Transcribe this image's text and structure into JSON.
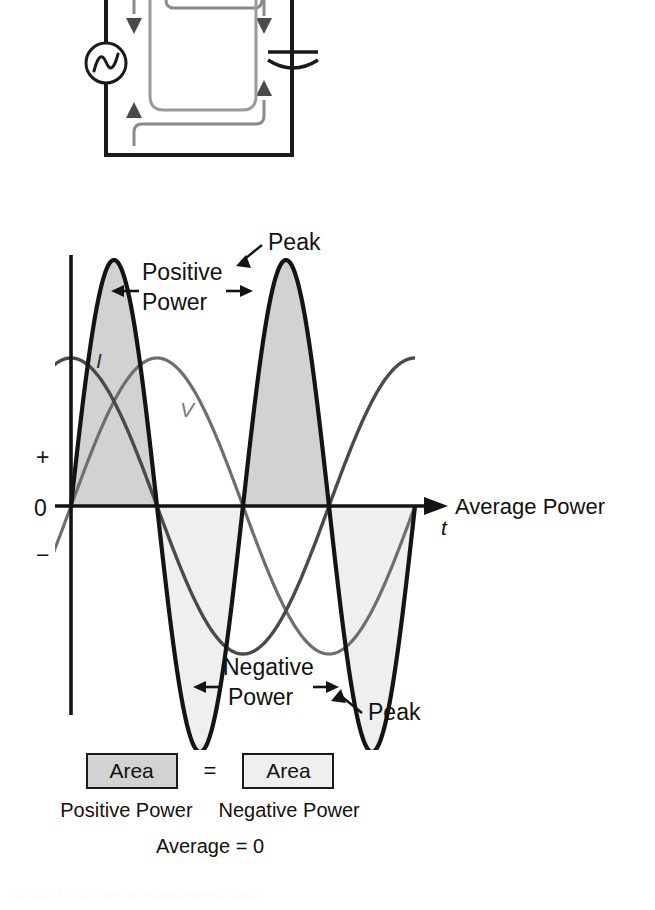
{
  "figure": {
    "caption": "FIGURE 15-10 Power in a capacitive AC circuit."
  },
  "circuit": {
    "title": "capacitive-ac-circuit",
    "source_label": "AC source",
    "component_label": "capacitor",
    "current_loop_inner": "charging current (clockwise)",
    "current_loop_outer": "discharging current (counter-clockwise)"
  },
  "chart_labels": {
    "axis_plus": "+",
    "axis_zero": "0",
    "axis_minus": "−",
    "axis_time": "t",
    "average_power": "Average Power",
    "current_curve": "I",
    "voltage_curve": "V",
    "positive_power_line1": "Positive",
    "positive_power_line2": "Power",
    "negative_power_line1": "Negative",
    "negative_power_line2": "Power",
    "peak_top": "Peak",
    "peak_bottom": "Peak"
  },
  "legend": {
    "area_positive_label": "Area",
    "area_negative_label": "Area",
    "equals": "=",
    "caption_positive": "Positive Power",
    "caption_negative": "Negative Power",
    "average_text": "Average = 0"
  },
  "colors": {
    "ink": "#111111",
    "curve_dark": "#1a1a1a",
    "curve_gray": "#6e6e6e",
    "fill_positive": "#d2d2d2",
    "fill_negative": "#efefef",
    "background": "#ffffff"
  },
  "chart_data": {
    "type": "line",
    "title": "Power in a capacitive AC circuit",
    "xlabel": "t",
    "ylabel": "",
    "x": [
      0,
      0.05,
      0.1,
      0.15,
      0.2,
      0.25,
      0.3,
      0.35,
      0.4,
      0.45,
      0.5,
      0.55,
      0.6,
      0.65,
      0.7,
      0.75,
      0.8,
      0.85,
      0.9,
      0.95,
      1.0
    ],
    "xlim": [
      0,
      1.0
    ],
    "ylim": [
      -1,
      1
    ],
    "grid": false,
    "legend_position": "inline-curve-labels",
    "annotations": [
      {
        "text": "Peak",
        "target": "positive power maximum (2nd lobe)"
      },
      {
        "text": "Peak",
        "target": "negative power minimum (2nd trough)"
      },
      {
        "text": "Positive Power",
        "target": "shaded area above zero axis"
      },
      {
        "text": "Negative Power",
        "target": "shaded area below zero axis"
      },
      {
        "text": "Average Power",
        "target": "zero axis line"
      }
    ],
    "series": [
      {
        "name": "I",
        "description": "current, leads voltage by 90 degrees",
        "color": "#1a1a1a",
        "amplitude": 0.62,
        "phase_deg": 90,
        "cycles": 1,
        "values": [
          0.62,
          0.53,
          0.27,
          -0.1,
          -0.43,
          -0.62,
          -0.6,
          -0.36,
          -0.02,
          0.32,
          0.57,
          0.62,
          0.44,
          0.12,
          -0.24,
          -0.52,
          -0.62,
          -0.5,
          -0.2,
          0.18,
          0.5
        ]
      },
      {
        "name": "V",
        "description": "voltage across capacitor",
        "color": "#6e6e6e",
        "amplitude": 0.62,
        "phase_deg": 0,
        "cycles": 1,
        "values": [
          0.0,
          0.31,
          0.55,
          0.62,
          0.47,
          0.17,
          -0.2,
          -0.5,
          -0.62,
          -0.53,
          -0.26,
          0.11,
          0.44,
          0.62,
          0.57,
          0.33,
          -0.04,
          -0.39,
          -0.61,
          -0.59,
          -0.35
        ]
      },
      {
        "name": "P",
        "description": "instantaneous power = V x I, double frequency, average zero",
        "color": "#1a1a1a",
        "amplitude": 1.0,
        "cycles": 2,
        "values": [
          0.0,
          0.64,
          0.99,
          0.78,
          0.06,
          -0.72,
          -1.0,
          -0.62,
          0.12,
          0.8,
          0.99,
          0.55,
          -0.18,
          -0.85,
          -0.96,
          -0.46,
          0.3,
          0.9,
          0.92,
          0.37,
          -0.42
        ]
      }
    ],
    "shaded_regions": [
      {
        "name": "positive-power",
        "fill": "#d2d2d2",
        "sign": "positive"
      },
      {
        "name": "negative-power",
        "fill": "#efefef",
        "sign": "negative"
      }
    ]
  }
}
